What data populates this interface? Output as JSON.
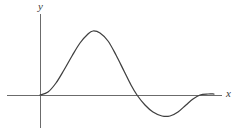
{
  "figure": {
    "background_color": "#ffffff",
    "line_color": "#3f3f3f",
    "axis_color": "#6b6b6b"
  },
  "axes": {
    "y_label": "y",
    "x_label": "x",
    "origin": {
      "x": 40,
      "y": 95
    },
    "x_axis": {
      "x_start": 7,
      "x_end": 222,
      "y": 95
    },
    "y_axis": {
      "x": 40,
      "y_start": 14,
      "y_end": 128
    }
  },
  "chart_data": {
    "type": "line",
    "title": "",
    "xlabel": "x",
    "ylabel": "y",
    "grid": false,
    "legend": false,
    "axis_ticks": [],
    "pixel_points": [
      {
        "x": 40,
        "y": 95
      },
      {
        "x": 48,
        "y": 92
      },
      {
        "x": 56,
        "y": 83
      },
      {
        "x": 64,
        "y": 70
      },
      {
        "x": 72,
        "y": 56
      },
      {
        "x": 80,
        "y": 43
      },
      {
        "x": 88,
        "y": 34
      },
      {
        "x": 93,
        "y": 31
      },
      {
        "x": 100,
        "y": 33
      },
      {
        "x": 108,
        "y": 41
      },
      {
        "x": 116,
        "y": 55
      },
      {
        "x": 124,
        "y": 71
      },
      {
        "x": 131,
        "y": 85
      },
      {
        "x": 137,
        "y": 95
      },
      {
        "x": 145,
        "y": 105
      },
      {
        "x": 153,
        "y": 112
      },
      {
        "x": 162,
        "y": 116
      },
      {
        "x": 170,
        "y": 116
      },
      {
        "x": 178,
        "y": 112
      },
      {
        "x": 186,
        "y": 105
      },
      {
        "x": 193,
        "y": 99
      },
      {
        "x": 200,
        "y": 95
      },
      {
        "x": 208,
        "y": 94
      },
      {
        "x": 214,
        "y": 94
      }
    ],
    "key_features": [
      {
        "name": "origin-start",
        "x": 40,
        "y": 95,
        "value": 0
      },
      {
        "name": "maximum",
        "x": 93,
        "y": 31,
        "value": 64
      },
      {
        "name": "zero-crossing",
        "x": 137,
        "y": 95,
        "value": 0
      },
      {
        "name": "minimum",
        "x": 170,
        "y": 116,
        "value": -21
      },
      {
        "name": "asymptotic-end",
        "x": 214,
        "y": 94,
        "value": 1
      }
    ],
    "xlim": [
      7,
      222
    ],
    "ylim": [
      14,
      128
    ]
  }
}
